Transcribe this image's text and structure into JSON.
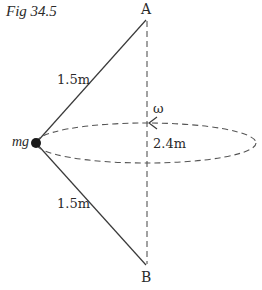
{
  "figure": {
    "caption": "Fig 34.5",
    "labels": {
      "top_point": "A",
      "bottom_point": "B",
      "mass": "mg",
      "upper_string_length": "1.5m",
      "lower_string_length": "1.5m",
      "angular_velocity": "ω",
      "circle_diameter": "2.4m"
    },
    "colors": {
      "line": "#3a3a3a",
      "dashed": "#555555",
      "mass": "#1a1a1a",
      "text": "#2a2a2a"
    }
  }
}
